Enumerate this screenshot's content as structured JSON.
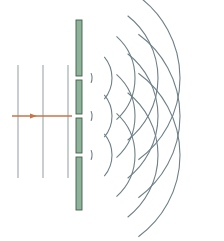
{
  "diagram": {
    "colors": {
      "background": "#ffffff",
      "barrier_fill": "#8fb39a",
      "barrier_stroke": "#3e5e48",
      "wave_stroke": "#6e8088",
      "plane_wave_stroke": "#9aa6ac",
      "arrow": "#c8744a"
    },
    "incident_plane_waves": {
      "x_positions": [
        18,
        43,
        68
      ],
      "y_top": 65,
      "y_bottom": 178
    },
    "arrow": {
      "label": "direction of propagation",
      "x_start": 12,
      "x_end": 72,
      "y": 116
    },
    "barrier": {
      "x": 76,
      "width": 6,
      "y_top": 20,
      "y_bottom": 210,
      "slit_gap": 4,
      "slit_centers_y": [
        78,
        116,
        155
      ]
    },
    "wavefronts": {
      "source_x": 79,
      "radii": [
        13,
        33,
        56,
        79,
        101
      ],
      "half_angles_deg": [
        22,
        40,
        48,
        52,
        54
      ]
    }
  }
}
